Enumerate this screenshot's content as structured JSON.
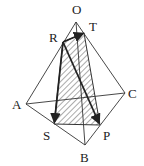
{
  "diagram": {
    "type": "tetrahedron-with-cross-section",
    "colors": {
      "line": "#333333",
      "hatch": "#444444",
      "background": "#ffffff"
    },
    "points": {
      "O": {
        "label": "O",
        "x": 76,
        "y": 22,
        "lx": 72,
        "ly": 14
      },
      "T": {
        "label": "T",
        "x": 84,
        "y": 33,
        "lx": 89,
        "ly": 31
      },
      "R": {
        "label": "R",
        "x": 63,
        "y": 42,
        "lx": 49,
        "ly": 42
      },
      "A": {
        "label": "A",
        "x": 26,
        "y": 104,
        "lx": 12,
        "ly": 109
      },
      "C": {
        "label": "C",
        "x": 125,
        "y": 93,
        "lx": 128,
        "ly": 98
      },
      "S": {
        "label": "S",
        "x": 54,
        "y": 124,
        "lx": 43,
        "ly": 140
      },
      "P": {
        "label": "P",
        "x": 100,
        "y": 125,
        "lx": 103,
        "ly": 140
      },
      "B": {
        "label": "B",
        "x": 85,
        "y": 145,
        "lx": 80,
        "ly": 162
      }
    },
    "edges": [
      "OA",
      "OB",
      "OC",
      "AB",
      "BC",
      "AC"
    ],
    "section": [
      "R",
      "T",
      "P",
      "S"
    ],
    "vectors": [
      "RT",
      "RS",
      "RP"
    ]
  }
}
